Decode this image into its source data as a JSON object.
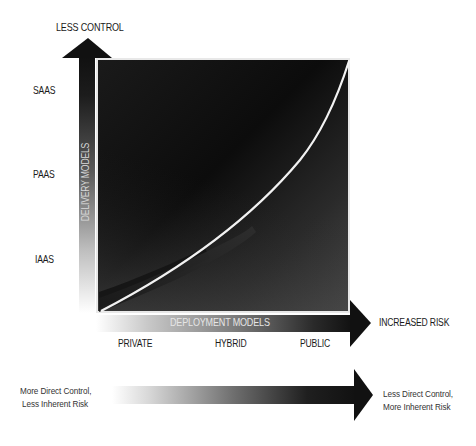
{
  "diagram": {
    "title_top": "LESS CONTROL",
    "vertical_axis": {
      "label": "DELIVERY MODELS",
      "levels": [
        "SAAS",
        "PAAS",
        "IAAS"
      ]
    },
    "horizontal_axis": {
      "label": "DEPLOYMENT MODELS",
      "end_label": "INCREASED RISK",
      "levels": [
        "PRIVATE",
        "HYBRID",
        "PUBLIC"
      ]
    },
    "bottom_scale": {
      "left_line1": "More Direct Control,",
      "left_line2": "Less Inherent Risk",
      "right_line1": "Less Direct Control,",
      "right_line2": "More Inherent Risk"
    },
    "caption": "",
    "colors": {
      "box_dark": "#0d0d0d",
      "box_light": "#5a5a5a",
      "curve": "#ffffff",
      "arrow": "#111111",
      "text": "#1a1a1a"
    }
  }
}
